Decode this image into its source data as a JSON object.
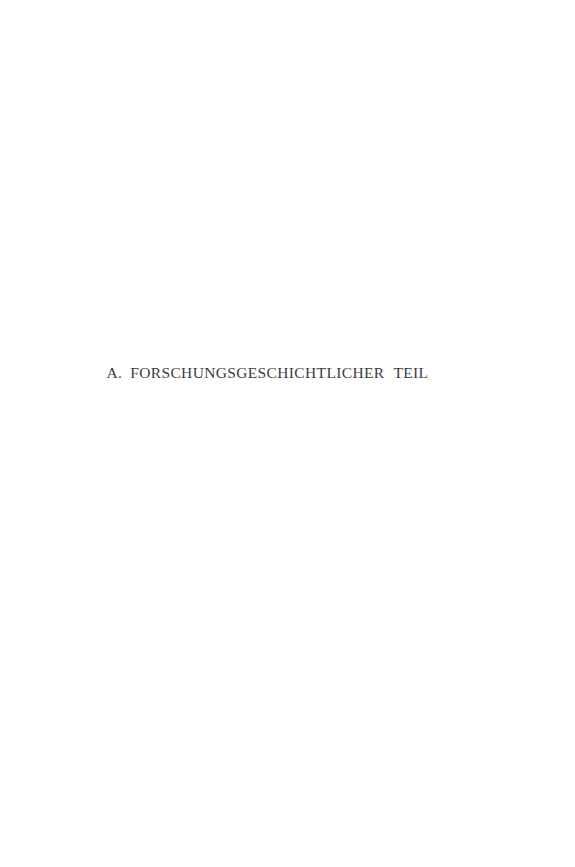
{
  "page": {
    "kind": "part-title-page",
    "background_color": "#ffffff",
    "text_color": "#3b3b3f",
    "width_px": 575,
    "height_px": 867
  },
  "part_title": {
    "full_text": "A. FORSCHUNGSGESCHICHTLICHER TEIL",
    "label": "A.",
    "words": [
      "FORSCHUNGSGESCHICHTLICHER",
      "TEIL"
    ],
    "language": "de"
  }
}
